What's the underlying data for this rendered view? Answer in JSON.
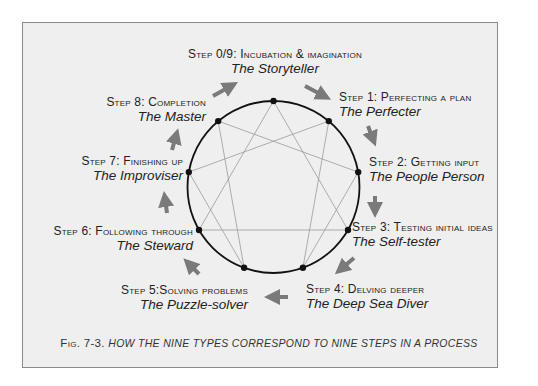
{
  "figure": {
    "caption_number": "Fig. 7-3.",
    "caption_text": "how the nine types correspond to nine steps in a process"
  },
  "colors": {
    "background": "#ffffff",
    "panel": "#efefef",
    "border": "#8a8a8a",
    "circle": "#111111",
    "lines": "#9a9a9a",
    "arrows": "#7a7a7a",
    "text": "#222222"
  },
  "steps": [
    {
      "step": "Step 0/9: Incubation & imagination",
      "role": "The Storyteller"
    },
    {
      "step": "Step 1: Perfecting a plan",
      "role": "The Perfecter"
    },
    {
      "step": "Step 2: Getting input",
      "role": "The People Person"
    },
    {
      "step": "Step 3: Testing initial ideas",
      "role": "The Self-tester"
    },
    {
      "step": "Step 4: Delving deeper",
      "role": "The Deep Sea Diver"
    },
    {
      "step": "Step 5:Solving problems",
      "role": "The Puzzle-solver"
    },
    {
      "step": "Step 6: Following through",
      "role": "The Steward"
    },
    {
      "step": "Step 7: Finishing up",
      "role": "The Improviser"
    },
    {
      "step": "Step 8: Completion",
      "role": "The Master"
    }
  ],
  "enneagram": {
    "center": [
      273.5,
      187
    ],
    "radius": 86,
    "points": [
      9,
      1,
      2,
      3,
      4,
      5,
      6,
      7,
      8
    ],
    "triangle": [
      9,
      3,
      6
    ],
    "hexad": [
      1,
      4,
      2,
      8,
      5,
      7
    ]
  }
}
